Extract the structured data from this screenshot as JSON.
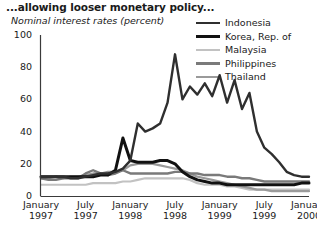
{
  "header": {
    "title": "...allowing looser monetary policy...",
    "subtitle": "Nominal interest rates (percent)"
  },
  "legend": {
    "position": "top-right",
    "items": [
      {
        "label": "Indonesia",
        "color": "#2f2f2f",
        "width": 2.4
      },
      {
        "label": "Korea, Rep. of",
        "color": "#111111",
        "width": 3.0
      },
      {
        "label": "Malaysia",
        "color": "#c2c2c2",
        "width": 2.2
      },
      {
        "label": "Philippines",
        "color": "#7a7a7a",
        "width": 2.4
      },
      {
        "label": "Thailand",
        "color": "#9a9a9a",
        "width": 2.2
      }
    ]
  },
  "axes": {
    "y_label": "Nominal interest rates (percent)",
    "y_ticks": [
      "0",
      "20",
      "40",
      "60",
      "80",
      "100"
    ],
    "y_min": 0,
    "y_max": 100,
    "x_ticks": [
      {
        "month": "January",
        "year": "1997"
      },
      {
        "month": "July",
        "year": "1997"
      },
      {
        "month": "January",
        "year": "1998"
      },
      {
        "month": "July",
        "year": "1998"
      },
      {
        "month": "January",
        "year": "1999"
      },
      {
        "month": "July",
        "year": "1999"
      },
      {
        "month": "January",
        "year": "2000"
      }
    ],
    "grid": false
  },
  "chart_data": {
    "type": "line",
    "title": "...allowing looser monetary policy...",
    "subtitle": "Nominal interest rates (percent)",
    "xlabel": "",
    "ylabel": "Nominal interest rates (percent)",
    "ylim": [
      0,
      100
    ],
    "xlim": [
      "January 1997",
      "January 2000"
    ],
    "x_tick_labels": [
      "January 1997",
      "July 1997",
      "January 1998",
      "July 1998",
      "January 1999",
      "July 1999",
      "January 2000"
    ],
    "x": [
      "1997-01",
      "1997-02",
      "1997-03",
      "1997-04",
      "1997-05",
      "1997-06",
      "1997-07",
      "1997-08",
      "1997-09",
      "1997-10",
      "1997-11",
      "1997-12",
      "1998-01",
      "1998-02",
      "1998-03",
      "1998-04",
      "1998-05",
      "1998-06",
      "1998-07",
      "1998-08",
      "1998-09",
      "1998-10",
      "1998-11",
      "1998-12",
      "1999-01",
      "1999-02",
      "1999-03",
      "1999-04",
      "1999-05",
      "1999-06",
      "1999-07",
      "1999-08",
      "1999-09",
      "1999-10",
      "1999-11",
      "1999-12",
      "2000-01"
    ],
    "series": [
      {
        "name": "Indonesia",
        "color": "#2f2f2f",
        "values": [
          12,
          12,
          12,
          12,
          11,
          11,
          12,
          13,
          14,
          14,
          15,
          17,
          22,
          45,
          40,
          42,
          45,
          58,
          88,
          60,
          68,
          63,
          70,
          62,
          75,
          58,
          72,
          54,
          64,
          40,
          30,
          26,
          21,
          15,
          13,
          12,
          12
        ]
      },
      {
        "name": "Korea, Rep. of",
        "color": "#111111",
        "values": [
          12,
          12,
          12,
          12,
          12,
          12,
          12,
          12,
          13,
          13,
          16,
          36,
          22,
          21,
          21,
          21,
          22,
          22,
          20,
          15,
          12,
          10,
          9,
          8,
          8,
          7,
          7,
          7,
          7,
          7,
          7,
          7,
          7,
          7,
          7,
          8,
          8
        ]
      },
      {
        "name": "Malaysia",
        "color": "#c2c2c2",
        "values": [
          7,
          7,
          7,
          7,
          7,
          7,
          7,
          8,
          8,
          8,
          8,
          9,
          9,
          10,
          11,
          11,
          11,
          11,
          11,
          11,
          10,
          8,
          7,
          7,
          7,
          6,
          6,
          5,
          4,
          4,
          4,
          4,
          4,
          4,
          4,
          4,
          4
        ]
      },
      {
        "name": "Philippines",
        "color": "#7a7a7a",
        "values": [
          11,
          10,
          10,
          11,
          11,
          11,
          14,
          16,
          14,
          13,
          14,
          16,
          14,
          14,
          14,
          14,
          14,
          14,
          15,
          15,
          14,
          14,
          13,
          13,
          13,
          12,
          12,
          11,
          11,
          10,
          9,
          9,
          9,
          9,
          9,
          9,
          9
        ]
      },
      {
        "name": "Thailand",
        "color": "#9a9a9a",
        "values": [
          11,
          11,
          12,
          11,
          12,
          12,
          13,
          14,
          14,
          15,
          15,
          16,
          19,
          20,
          20,
          20,
          19,
          18,
          17,
          16,
          14,
          12,
          11,
          10,
          9,
          8,
          7,
          6,
          5,
          4,
          4,
          3,
          3,
          3,
          3,
          3,
          3
        ]
      }
    ]
  }
}
